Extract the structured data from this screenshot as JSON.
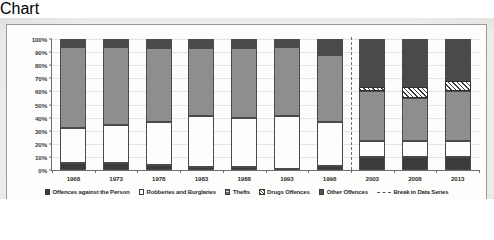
{
  "chart_data": {
    "type": "bar",
    "subtype": "stacked-100-percent",
    "title": "",
    "xlabel": "",
    "ylabel": "",
    "ylim": [
      0,
      100
    ],
    "ytick_labels": [
      "100%",
      "90%",
      "80%",
      "70%",
      "60%",
      "50%",
      "40%",
      "30%",
      "20%",
      "10%",
      "0%"
    ],
    "ytick_values": [
      100,
      90,
      80,
      70,
      60,
      50,
      40,
      30,
      20,
      10,
      0
    ],
    "grid": true,
    "legend_position": "bottom",
    "categories": [
      "1968",
      "1973",
      "1978",
      "1983",
      "1988",
      "1993",
      "1998",
      "2003",
      "2008",
      "2013"
    ],
    "series": [
      {
        "name": "Offences against the Person",
        "swatch": "person",
        "color": "#3b3b3b",
        "values": [
          5,
          5,
          4,
          2,
          2,
          1,
          3,
          10,
          10,
          10
        ]
      },
      {
        "name": "Robberies and Burglaries",
        "swatch": "robbery",
        "color": "#fdfdfd",
        "values": [
          27,
          29,
          33,
          39,
          38,
          40,
          34,
          12,
          12,
          12
        ]
      },
      {
        "name": "Thefts",
        "swatch": "theft",
        "color": "#8e8e8e",
        "values": [
          62,
          60,
          56,
          52,
          53,
          53,
          51,
          38,
          33,
          38
        ]
      },
      {
        "name": "Drugs Offences",
        "swatch": "drugs",
        "color": "#3d3d3d",
        "hatch": "diagonal",
        "values": [
          0,
          0,
          0,
          0,
          0,
          0,
          0,
          3,
          8,
          8
        ]
      },
      {
        "name": "Other Offences",
        "swatch": "other",
        "color": "#4a4a4a",
        "values": [
          6,
          6,
          7,
          7,
          7,
          6,
          12,
          37,
          37,
          32
        ]
      }
    ],
    "annotations": [
      {
        "type": "vertical-dashed-line",
        "label": "Break in Data Series",
        "between": [
          "1998",
          "2003"
        ]
      }
    ]
  },
  "legend": {
    "items": [
      {
        "label": "Offences against the Person",
        "swatch": "person"
      },
      {
        "label": "Robberies and Burglaries",
        "swatch": "robbery"
      },
      {
        "label": "Thefts",
        "swatch": "theft"
      },
      {
        "label": "Drugs Offences",
        "swatch": "drugs"
      },
      {
        "label": "Other Offences",
        "swatch": "other"
      },
      {
        "label": "Break in Data Series",
        "swatch": "dashed-line"
      }
    ]
  }
}
